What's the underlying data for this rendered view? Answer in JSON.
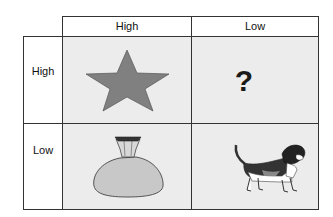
{
  "matrix": {
    "column_headers": [
      "High",
      "Low"
    ],
    "row_headers": [
      "High",
      "Low"
    ],
    "cells": [
      {
        "row": "High",
        "column": "High",
        "icon": "star-icon",
        "fill": "#808080"
      },
      {
        "row": "High",
        "column": "Low",
        "icon": "question-mark-icon",
        "symbol": "?"
      },
      {
        "row": "Low",
        "column": "High",
        "icon": "money-bag-icon",
        "fill": "#c8c8c8"
      },
      {
        "row": "Low",
        "column": "Low",
        "icon": "dog-icon"
      }
    ],
    "cell_background": "#ececec",
    "border_color": "#333333"
  }
}
